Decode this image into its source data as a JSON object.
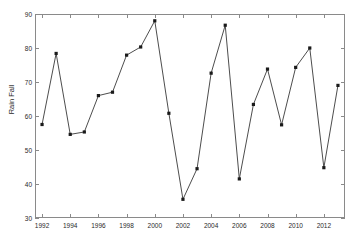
{
  "chart_data": {
    "type": "line",
    "title": "",
    "subtitle": "",
    "xlabel": "",
    "ylabel": "Rain Fall",
    "xlim": [
      1991.5,
      2013.5
    ],
    "ylim": [
      30,
      90
    ],
    "grid": false,
    "legend": null,
    "marker": "filled-square",
    "line_color": "#4d4d4d",
    "marker_color": "#1a1a1a",
    "axis_color": "#8a8a8a",
    "x": [
      1992,
      1993,
      1994,
      1995,
      1996,
      1997,
      1998,
      1999,
      2000,
      2001,
      2002,
      2003,
      2004,
      2005,
      2006,
      2007,
      2008,
      2009,
      2010,
      2011,
      2012,
      2013
    ],
    "values": [
      57.5,
      78.4,
      54.6,
      55.3,
      66.0,
      67.0,
      77.9,
      80.3,
      88.0,
      60.8,
      35.5,
      44.5,
      72.6,
      86.7,
      41.5,
      63.4,
      73.8,
      57.4,
      74.3,
      80.0,
      44.8,
      69.0
    ],
    "categories": [
      "1992",
      "1993",
      "1994",
      "1995",
      "1996",
      "1997",
      "1998",
      "1999",
      "2000",
      "2001",
      "2002",
      "2003",
      "2004",
      "2005",
      "2006",
      "2007",
      "2008",
      "2009",
      "2010",
      "2011",
      "2012",
      "2013"
    ],
    "yticks": [
      30,
      40,
      50,
      60,
      70,
      80,
      90
    ],
    "ytick_labels": [
      "30",
      "40",
      "50",
      "60",
      "70",
      "80",
      "90"
    ],
    "xticks": [
      1992,
      1994,
      1996,
      1998,
      2000,
      2002,
      2004,
      2006,
      2008,
      2010,
      2012
    ],
    "xtick_labels": [
      "1992",
      "1994",
      "1996",
      "1998",
      "2000",
      "2002",
      "2004",
      "2006",
      "2008",
      "2010",
      "2012"
    ]
  },
  "axis": {
    "ylabel_text": "Rain Fall"
  }
}
